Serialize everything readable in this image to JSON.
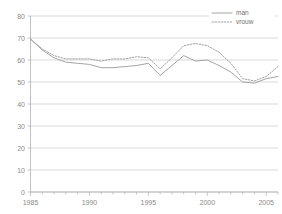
{
  "chart_data": {
    "type": "line",
    "title": "",
    "xlabel": "",
    "ylabel": "",
    "xlim": [
      1985,
      2006
    ],
    "ylim": [
      0,
      80
    ],
    "ytick_step": 10,
    "grid": true,
    "legend_position": "top-right",
    "yticks": [
      "0",
      "10",
      "20",
      "30",
      "40",
      "50",
      "60",
      "70",
      "80"
    ],
    "ytick_values": [
      0,
      10,
      20,
      30,
      40,
      50,
      60,
      70,
      80
    ],
    "xticks": [
      "1985",
      "1990",
      "1995",
      "2000",
      "2005"
    ],
    "xtick_values": [
      1985,
      1990,
      1995,
      2000,
      2005
    ],
    "x": [
      1985,
      1986,
      1987,
      1988,
      1989,
      1990,
      1991,
      1992,
      1993,
      1994,
      1995,
      1996,
      1997,
      1998,
      1999,
      2000,
      2001,
      2002,
      2003,
      2004,
      2005,
      2006
    ],
    "series": [
      {
        "name": "man",
        "style": "solid",
        "color": "#9a9a9a",
        "values": [
          69.5,
          64.5,
          61.0,
          59.0,
          58.5,
          58.0,
          56.5,
          56.5,
          57.0,
          57.5,
          58.5,
          53.0,
          57.5,
          62.0,
          59.5,
          60.0,
          57.5,
          54.5,
          50.0,
          49.5,
          51.5,
          52.5
        ]
      },
      {
        "name": "vrouw",
        "style": "dotted",
        "color": "#9a9a9a",
        "values": [
          69.5,
          65.0,
          62.0,
          60.5,
          60.5,
          60.5,
          59.5,
          60.5,
          60.5,
          61.5,
          61.0,
          56.0,
          61.0,
          66.5,
          67.5,
          66.5,
          63.5,
          58.5,
          51.5,
          50.5,
          52.5,
          57.0
        ]
      }
    ],
    "legend": [
      {
        "label": "man",
        "style": "solid"
      },
      {
        "label": "vrouw",
        "style": "dotted"
      }
    ]
  }
}
